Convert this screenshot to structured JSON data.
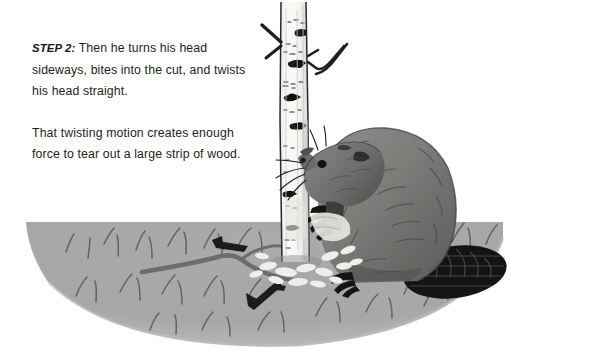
{
  "page": {
    "background_color": "#ffffff",
    "width": 593,
    "height": 363
  },
  "text": {
    "step_label": "STEP 2:",
    "paragraph_1": " Then he turns his head sideways, bites into the cut, and twists his head straight.",
    "paragraph_2": "That twisting motion creates enough force to tear out a large strip of wood."
  },
  "illustration": {
    "caption": "A beaver gripping a birch tree trunk, turning its head sideways to bite and twist out a strip of wood, standing on an oval patch of grassy ground with wood chips and fallen twigs.",
    "elements": [
      {
        "name": "ground-ellipse",
        "label": "Grassy ground",
        "color": "#a9a9a9"
      },
      {
        "name": "birch-tree-trunk",
        "label": "Birch tree trunk",
        "color": "#f4f4f2"
      },
      {
        "name": "tree-branch-left",
        "label": "Left branch",
        "color": "#231f20"
      },
      {
        "name": "tree-branch-right",
        "label": "Right forked branch",
        "color": "#231f20"
      },
      {
        "name": "beaver-body",
        "label": "Beaver body",
        "color": "#7d7d7b"
      },
      {
        "name": "beaver-head",
        "label": "Beaver head turned sideways",
        "color": "#6f6f6d"
      },
      {
        "name": "beaver-tail",
        "label": "Scaly beaver tail",
        "color": "#1b1b1b"
      },
      {
        "name": "beaver-front-paw",
        "label": "Front paw gripping trunk",
        "color": "#141414"
      },
      {
        "name": "beaver-hind-foot",
        "label": "Hind foot",
        "color": "#141414"
      },
      {
        "name": "wood-chips",
        "label": "Wood chips at base of tree",
        "color": "#ededea"
      },
      {
        "name": "fallen-twig",
        "label": "Fallen twig on ground",
        "color": "#6e6e6e"
      },
      {
        "name": "grass-tufts",
        "label": "Grass tufts",
        "color": "#5d5d5d"
      }
    ],
    "colors": {
      "ground": "#a9a9a9",
      "trunk": "#f4f4f2",
      "trunk_shadow": "#cfcfcd",
      "beaver_body": "#7d7d7b",
      "beaver_dark": "#4a4a48",
      "tail": "#151515",
      "ink": "#231f20",
      "grass": "#5d5d5d"
    }
  }
}
